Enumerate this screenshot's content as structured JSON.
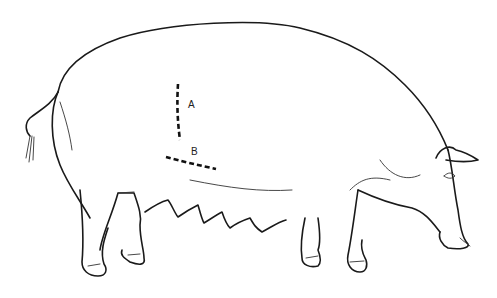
{
  "diagram": {
    "style": "black line drawing on white",
    "measurement_lines": [
      {
        "id": "A",
        "label": "A",
        "orientation": "vertical",
        "style": "dashed"
      },
      {
        "id": "B",
        "label": "B",
        "orientation": "horizontal",
        "style": "dashed"
      }
    ],
    "colors": {
      "line": "#1a1a1a",
      "background": "#ffffff"
    }
  }
}
